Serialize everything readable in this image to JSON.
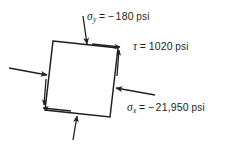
{
  "figure": {
    "name": "stress-element-diagram",
    "type": "2d-stress-element",
    "background": "#ffffff",
    "ink_color": "#231f20"
  },
  "element": {
    "shape": "rotated-square",
    "corners": {
      "top_left": [
        53,
        41
      ],
      "top_right": [
        118,
        48
      ],
      "bottom_right": [
        110,
        117
      ],
      "bottom_left": [
        45,
        110
      ]
    },
    "rotation_note": "square tilted slightly clockwise"
  },
  "labels": {
    "sigma_y": {
      "symbol": "σ",
      "subscript": "y",
      "equals": "=",
      "minus": "−",
      "value": "180",
      "unit": "psi",
      "full_text": "σy = − 180 psi"
    },
    "tau": {
      "symbol": "τ",
      "subscript": "",
      "equals": "=",
      "minus": "",
      "value": "1020",
      "unit": "psi",
      "full_text": "τ = 1020 psi"
    },
    "sigma_x": {
      "symbol": "σ",
      "subscript": "x",
      "equals": "=",
      "minus": "−",
      "value": "21,950",
      "unit": "psi",
      "full_text": "σx = − 21,950 psi"
    }
  },
  "arrows": {
    "normal": [
      {
        "name": "sigma-y-top-arrow",
        "direction": "down",
        "sense": "compressive-inward",
        "face": "top"
      },
      {
        "name": "sigma-y-bottom-arrow",
        "direction": "up",
        "sense": "compressive-inward",
        "face": "bottom"
      },
      {
        "name": "sigma-x-left-arrow",
        "direction": "right",
        "sense": "compressive-inward",
        "face": "left"
      },
      {
        "name": "sigma-x-right-arrow",
        "direction": "left",
        "sense": "compressive-inward",
        "face": "right"
      }
    ],
    "shear": [
      {
        "name": "tau-top-arrow",
        "direction": "right",
        "face": "top"
      },
      {
        "name": "tau-right-arrow",
        "direction": "up",
        "face": "right"
      },
      {
        "name": "tau-bottom-arrow",
        "direction": "left",
        "face": "bottom"
      },
      {
        "name": "tau-left-arrow",
        "direction": "down",
        "face": "left"
      }
    ],
    "shear_sense": "counterclockwise"
  }
}
